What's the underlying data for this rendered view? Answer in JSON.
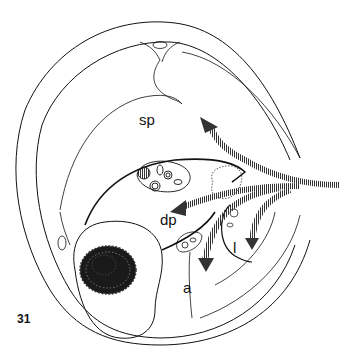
{
  "figure": {
    "number": "31",
    "type": "anatomical line drawing (cross-section with migration arrows)",
    "labels": {
      "sp": "sp",
      "dp": "dp",
      "l": "l",
      "a": "a"
    },
    "colors": {
      "line": "#111111",
      "background": "#ffffff",
      "arrow": "#555555"
    },
    "arrows": [
      {
        "name": "arrow-to-sp",
        "direction": "up-left"
      },
      {
        "name": "arrow-to-dp",
        "direction": "left"
      },
      {
        "name": "arrow-to-a",
        "direction": "down"
      },
      {
        "name": "arrow-to-l",
        "direction": "down"
      }
    ]
  }
}
